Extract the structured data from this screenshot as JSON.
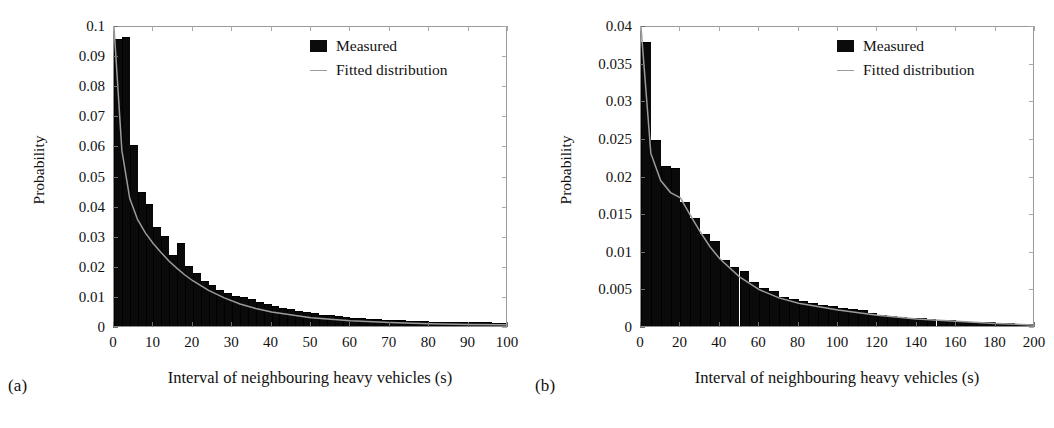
{
  "figure": {
    "panels": [
      {
        "caption": "(a)",
        "xlabel": "Interval of neighbouring heavy vehicles (s)",
        "ylabel": "Probability",
        "legend": [
          {
            "label": "Measured",
            "marker": "square-swatch-icon",
            "color": "#0b0b0b"
          },
          {
            "label": "Fitted distribution",
            "marker": "line-swatch-icon",
            "color": "#9b9b9b"
          }
        ]
      },
      {
        "caption": "(b)",
        "xlabel": "Interval of neighbouring heavy vehicles (s)",
        "ylabel": "Probability",
        "legend": [
          {
            "label": "Measured",
            "marker": "square-swatch-icon",
            "color": "#0b0b0b"
          },
          {
            "label": "Fitted distribution",
            "marker": "line-swatch-icon",
            "color": "#9b9b9b"
          }
        ]
      }
    ]
  },
  "chart_data": [
    {
      "type": "bar",
      "title": "",
      "subtitle": "(a)",
      "xlabel": "Interval of neighbouring heavy vehicles (s)",
      "ylabel": "Probability",
      "xlim": [
        0,
        100
      ],
      "ylim": [
        0,
        0.1
      ],
      "xticks": [
        0,
        10,
        20,
        30,
        40,
        50,
        60,
        70,
        80,
        90,
        100
      ],
      "xticklabels": [
        "0",
        "10",
        "20",
        "30",
        "40",
        "50",
        "60",
        "70",
        "80",
        "90",
        "100"
      ],
      "yticks": [
        0,
        0.01,
        0.02,
        0.03,
        0.04,
        0.05,
        0.06,
        0.07,
        0.08,
        0.09,
        0.1
      ],
      "yticklabels": [
        "0",
        "0.01",
        "0.02",
        "0.03",
        "0.04",
        "0.05",
        "0.06",
        "0.07",
        "0.08",
        "0.09",
        "0.1"
      ],
      "grid": false,
      "legend": [
        "Measured",
        "Fitted distribution"
      ],
      "legend_position": "upper right",
      "bin_width": 2,
      "bin_centers": [
        1,
        3,
        5,
        7,
        9,
        11,
        13,
        15,
        17,
        19,
        21,
        23,
        25,
        27,
        29,
        31,
        33,
        35,
        37,
        39,
        41,
        43,
        45,
        47,
        49,
        51,
        53,
        55,
        57,
        59,
        61,
        63,
        65,
        67,
        69,
        71,
        73,
        75,
        77,
        79,
        81,
        83,
        85,
        87,
        89,
        91,
        93,
        95,
        97,
        99
      ],
      "series": [
        {
          "name": "Measured",
          "type": "bar",
          "values": [
            0.0955,
            0.096,
            0.06,
            0.0445,
            0.0405,
            0.033,
            0.03,
            0.0235,
            0.0275,
            0.02,
            0.0175,
            0.015,
            0.0135,
            0.012,
            0.011,
            0.01,
            0.0095,
            0.009,
            0.008,
            0.0072,
            0.0068,
            0.006,
            0.0055,
            0.005,
            0.0045,
            0.0042,
            0.0038,
            0.0035,
            0.0032,
            0.003,
            0.0028,
            0.0026,
            0.0024,
            0.0022,
            0.0021,
            0.002,
            0.0019,
            0.0018,
            0.0017,
            0.0016,
            0.0015,
            0.0015,
            0.0014,
            0.0014,
            0.0013,
            0.0013,
            0.0012,
            0.0012,
            0.0011,
            0.0011
          ]
        },
        {
          "name": "Fitted distribution",
          "type": "line",
          "x": [
            0,
            2,
            4,
            6,
            8,
            10,
            12,
            14,
            16,
            18,
            20,
            24,
            28,
            32,
            36,
            40,
            50,
            60,
            70,
            80,
            90,
            100
          ],
          "values": [
            0.1,
            0.059,
            0.043,
            0.036,
            0.0315,
            0.028,
            0.025,
            0.0222,
            0.0198,
            0.0176,
            0.0157,
            0.0125,
            0.01,
            0.008,
            0.0065,
            0.0053,
            0.0034,
            0.0024,
            0.0018,
            0.0014,
            0.0012,
            0.0011
          ]
        }
      ]
    },
    {
      "type": "bar",
      "title": "",
      "subtitle": "(b)",
      "xlabel": "Interval of neighbouring heavy vehicles (s)",
      "ylabel": "Probability",
      "xlim": [
        0,
        200
      ],
      "ylim": [
        0,
        0.04
      ],
      "xticks": [
        0,
        20,
        40,
        60,
        80,
        100,
        120,
        140,
        160,
        180,
        200
      ],
      "xticklabels": [
        "0",
        "20",
        "40",
        "60",
        "80",
        "100",
        "120",
        "140",
        "160",
        "180",
        "200"
      ],
      "yticks": [
        0,
        0.005,
        0.01,
        0.015,
        0.02,
        0.025,
        0.03,
        0.035,
        0.04
      ],
      "yticklabels": [
        "0",
        "0.005",
        "0.01",
        "0.015",
        "0.02",
        "0.025",
        "0.03",
        "0.035",
        "0.04"
      ],
      "grid": false,
      "legend": [
        "Measured",
        "Fitted distribution"
      ],
      "legend_position": "upper right",
      "bin_width": 5,
      "bin_centers": [
        2.5,
        7.5,
        12.5,
        17.5,
        22.5,
        27.5,
        32.5,
        37.5,
        42.5,
        47.5,
        52.5,
        57.5,
        62.5,
        67.5,
        72.5,
        77.5,
        82.5,
        87.5,
        92.5,
        97.5,
        102.5,
        107.5,
        112.5,
        117.5,
        122.5,
        127.5,
        132.5,
        137.5,
        142.5,
        147.5,
        152.5,
        157.5,
        162.5,
        167.5,
        172.5,
        177.5,
        182.5,
        187.5,
        192.5,
        197.5
      ],
      "series": [
        {
          "name": "Measured",
          "type": "bar",
          "values": [
            0.0378,
            0.0247,
            0.0212,
            0.021,
            0.0165,
            0.0143,
            0.0122,
            0.0113,
            0.0088,
            0.0078,
            0.0073,
            0.0058,
            0.005,
            0.0047,
            0.0039,
            0.0036,
            0.0033,
            0.0031,
            0.0028,
            0.0027,
            0.0024,
            0.0022,
            0.0021,
            0.0017,
            0.0015,
            0.0013,
            0.0012,
            0.0011,
            0.001,
            0.0009,
            0.0008,
            0.0008,
            0.0007,
            0.0006,
            0.0006,
            0.0005,
            0.0004,
            0.0004,
            0.0003,
            0.0003
          ]
        },
        {
          "name": "Fitted distribution",
          "type": "line",
          "x": [
            0,
            5,
            10,
            15,
            20,
            25,
            30,
            35,
            40,
            50,
            60,
            70,
            80,
            100,
            120,
            140,
            160,
            180,
            200
          ],
          "values": [
            0.04,
            0.0232,
            0.0196,
            0.018,
            0.0173,
            0.015,
            0.0128,
            0.0108,
            0.0092,
            0.0068,
            0.0051,
            0.004,
            0.0033,
            0.0024,
            0.0017,
            0.0012,
            0.0009,
            0.0006,
            0.0004
          ]
        }
      ]
    }
  ]
}
